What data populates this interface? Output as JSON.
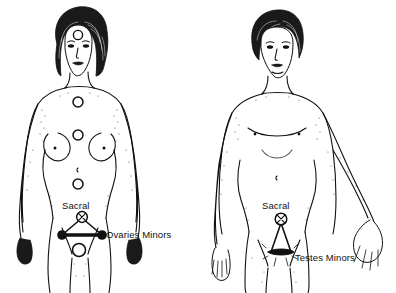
{
  "illustration": {
    "title": "Chakra and minor energy centre locations on female and male figures",
    "background_color": "#ffffff",
    "ink_color": "#111111",
    "width": 396,
    "height": 293
  },
  "figures": [
    {
      "id": "female-figure",
      "sex": "female",
      "position": "left",
      "energy_centers": [
        {
          "name": "brow-center",
          "marker": "open-circle",
          "cx": 78,
          "cy": 35,
          "r": 5
        },
        {
          "name": "throat-chest-center",
          "marker": "open-circle",
          "cx": 78,
          "cy": 102,
          "r": 5
        },
        {
          "name": "heart-center",
          "marker": "open-circle",
          "cx": 78,
          "cy": 135,
          "r": 5
        },
        {
          "name": "solar-center",
          "marker": "open-circle",
          "cx": 78,
          "cy": 184,
          "r": 5
        },
        {
          "name": "root-center",
          "marker": "open-circle",
          "cx": 79,
          "cy": 250,
          "r": 7
        }
      ],
      "sacral_marker": {
        "name": "sacral-crossed-circle",
        "cx": 82,
        "cy": 217,
        "r": 5.5
      },
      "minor_nodes": [
        {
          "name": "ovary-node-left",
          "cx": 62,
          "cy": 235,
          "r": 5
        },
        {
          "name": "ovary-node-right",
          "cx": 102,
          "cy": 235,
          "r": 5
        }
      ],
      "labels": {
        "sacral": "Sacral",
        "minors": "Ovaries Minors"
      }
    },
    {
      "id": "male-figure",
      "sex": "male",
      "position": "right",
      "energy_centers": [],
      "sacral_marker": {
        "name": "sacral-crossed-circle",
        "cx": 281,
        "cy": 219,
        "r": 6
      },
      "minor_nodes": [
        {
          "name": "testis-node-left",
          "cx": 271,
          "cy": 252,
          "r": 5.5
        },
        {
          "name": "testis-node-right",
          "cx": 291,
          "cy": 252,
          "r": 5.5
        }
      ],
      "labels": {
        "sacral": "Sacral",
        "minors": "Testes Minors"
      }
    }
  ],
  "label_positions": {
    "female_sacral": {
      "x": 62,
      "y": 209
    },
    "female_minors": {
      "x": 106,
      "y": 237
    },
    "male_sacral": {
      "x": 262,
      "y": 209
    },
    "male_minors": {
      "x": 295,
      "y": 260
    }
  }
}
